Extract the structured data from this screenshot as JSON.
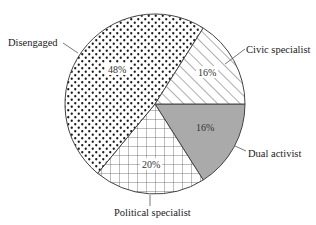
{
  "chart_data": {
    "type": "pie",
    "title": "",
    "start_angle_deg": 0,
    "direction": "clockwise",
    "slices": [
      {
        "label": "Dual activist",
        "value": 16,
        "pct_label": "16%",
        "pattern": "solid-grey",
        "color": "#aaaaaa"
      },
      {
        "label": "Political specialist",
        "value": 20,
        "pct_label": "20%",
        "pattern": "grid",
        "color": "#ffffff"
      },
      {
        "label": "Disengaged",
        "value": 48,
        "pct_label": "48%",
        "pattern": "dots",
        "color": "#ffffff"
      },
      {
        "label": "Civic specialist",
        "value": 16,
        "pct_label": "16%",
        "pattern": "diagonal-hatch",
        "color": "#ffffff"
      }
    ],
    "legend": "none (direct labels with leader lines)",
    "units": "percent"
  },
  "labels": {
    "dual": "Dual activist",
    "political": "Political specialist",
    "disengaged": "Disengaged",
    "civic": "Civic specialist"
  },
  "pcts": {
    "dual": "16%",
    "political": "20%",
    "disengaged": "48%",
    "civic": "16%"
  },
  "colors": {
    "outline": "#444444",
    "grey_fill": "#aaaaaa",
    "pattern_ink": "#222222"
  }
}
